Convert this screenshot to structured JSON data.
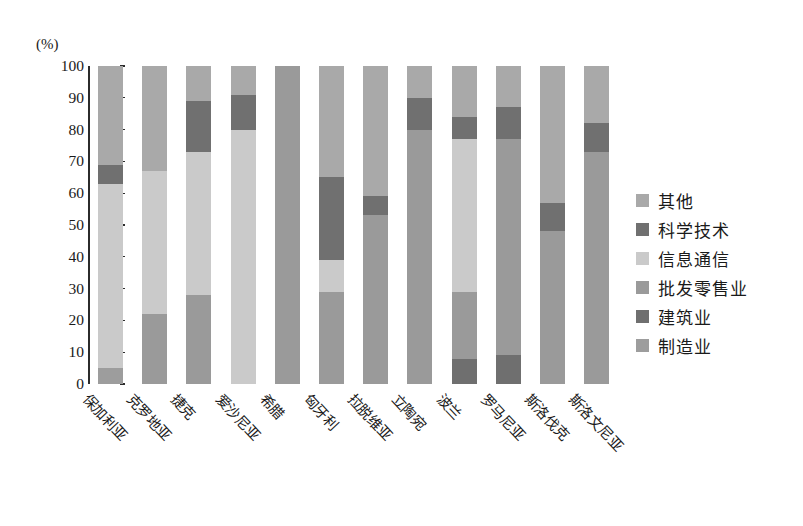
{
  "chart_data": {
    "type": "bar",
    "subtype": "stacked-100-percent",
    "title": "",
    "xlabel": "",
    "ylabel": "(%)",
    "ylim": [
      0,
      100
    ],
    "grid": false,
    "legend_position": "right",
    "y_ticks": [
      "100",
      "90",
      "80",
      "70",
      "60",
      "50",
      "40",
      "30",
      "20",
      "10",
      "0"
    ],
    "categories": [
      "保加利亚",
      "克罗地亚",
      "捷克",
      "爱沙尼亚",
      "希腊",
      "匈牙利",
      "拉脱维亚",
      "立陶宛",
      "波兰",
      "罗马尼亚",
      "斯洛伐克",
      "斯洛文尼亚"
    ],
    "series": [
      {
        "name": "制造业",
        "color": "#9d9d9d",
        "values": [
          5,
          0,
          0,
          0,
          0,
          0,
          0,
          0,
          0,
          0,
          0,
          0
        ]
      },
      {
        "name": "建筑业",
        "color": "#6f6f6f",
        "values": [
          0,
          0,
          0,
          0,
          0,
          0,
          0,
          0,
          8,
          9,
          0,
          0
        ]
      },
      {
        "name": "批发零售业",
        "color": "#9a9a9a",
        "values": [
          0,
          22,
          28,
          0,
          100,
          29,
          53,
          80,
          21,
          68,
          48,
          73
        ]
      },
      {
        "name": "信息通信",
        "color": "#cacaca",
        "values": [
          58,
          45,
          45,
          80,
          0,
          10,
          0,
          0,
          48,
          0,
          0,
          0
        ]
      },
      {
        "name": "科学技术",
        "color": "#707070",
        "values": [
          6,
          0,
          16,
          11,
          0,
          26,
          6,
          10,
          7,
          10,
          9,
          9
        ]
      },
      {
        "name": "其他",
        "color": "#a9a9a9",
        "values": [
          31,
          33,
          11,
          9,
          0,
          35,
          41,
          10,
          16,
          13,
          43,
          18
        ]
      }
    ],
    "stack_order_bottom_to_top": [
      "制造业",
      "建筑业",
      "批发零售业",
      "信息通信",
      "科学技术",
      "其他"
    ]
  },
  "legend": {
    "items": [
      {
        "label": "其他",
        "color": "#a9a9a9"
      },
      {
        "label": "科学技术",
        "color": "#707070"
      },
      {
        "label": "信息通信",
        "color": "#cacaca"
      },
      {
        "label": "批发零售业",
        "color": "#9a9a9a"
      },
      {
        "label": "建筑业",
        "color": "#6f6f6f"
      },
      {
        "label": "制造业",
        "color": "#9d9d9d"
      }
    ]
  },
  "axis": {
    "y_unit_label": "(%)"
  }
}
